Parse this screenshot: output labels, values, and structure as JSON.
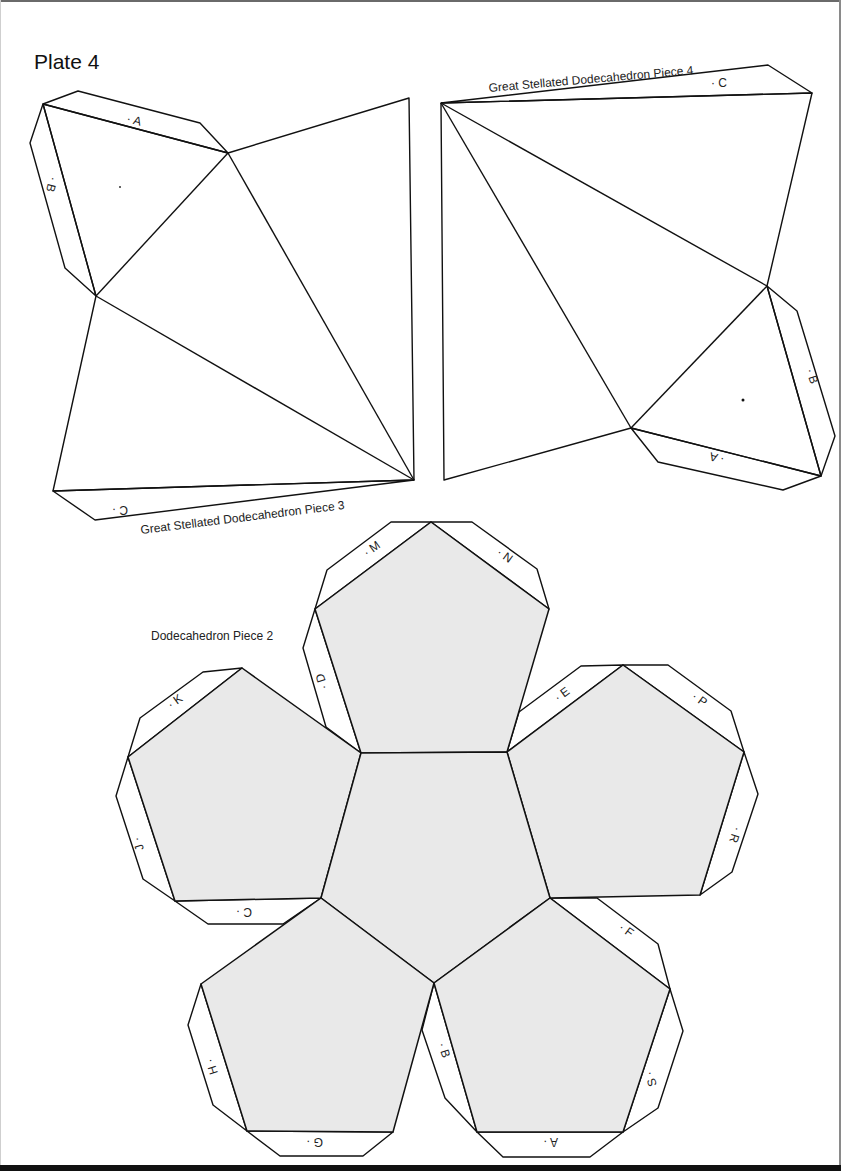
{
  "plate": {
    "title": "Plate 4"
  },
  "colors": {
    "face_fill": "#e9e9e9",
    "line": "#111111",
    "paper": "#ffffff"
  },
  "piece3": {
    "caption": "Great Stellated Dodecahedron Piece 3",
    "tabs": [
      {
        "label": "· A"
      },
      {
        "label": "· B"
      },
      {
        "label": "C ·"
      }
    ]
  },
  "piece4": {
    "caption": "Great Stellated Dodecahedron Piece 4",
    "tabs": [
      {
        "label": "· C"
      },
      {
        "label": "· B"
      },
      {
        "label": "· A"
      }
    ]
  },
  "dodeca": {
    "caption": "Dodecahedron Piece 2",
    "tabs": [
      {
        "label": "· M"
      },
      {
        "label": "· N"
      },
      {
        "label": "· D"
      },
      {
        "label": "· K"
      },
      {
        "label": "J ·"
      },
      {
        "label": "C ·"
      },
      {
        "label": "· E"
      },
      {
        "label": "· P"
      },
      {
        "label": "· R"
      },
      {
        "label": "· F"
      },
      {
        "label": "S ·"
      },
      {
        "label": "A ·"
      },
      {
        "label": "· B"
      },
      {
        "label": "H ·"
      },
      {
        "label": "G ·"
      }
    ]
  }
}
